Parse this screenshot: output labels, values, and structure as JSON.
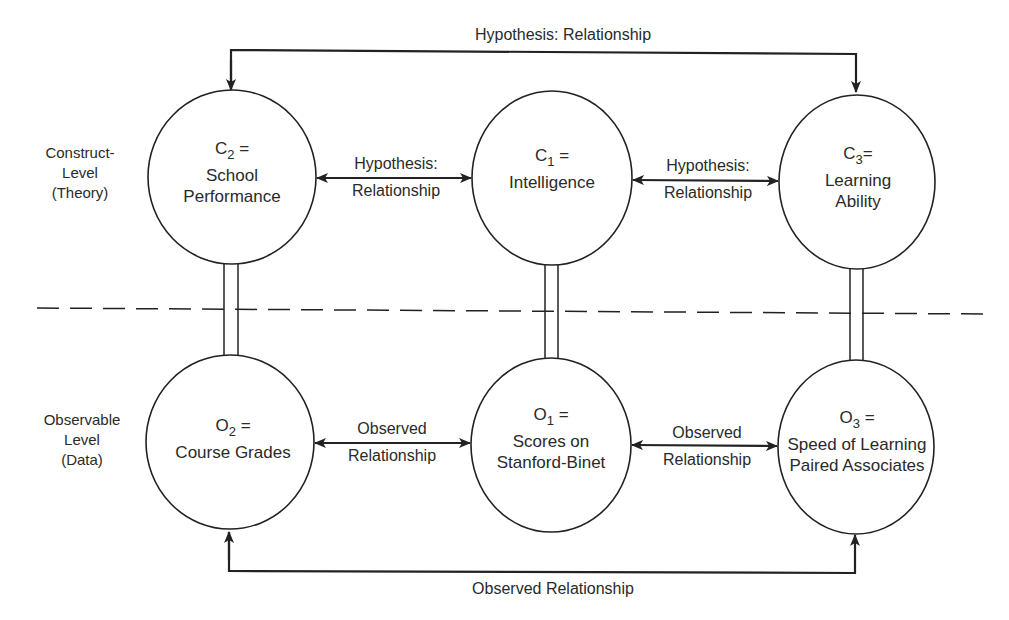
{
  "diagram": {
    "levels": {
      "construct": [
        "Construct-",
        "Level",
        "(Theory)"
      ],
      "observable": [
        "Observable",
        "Level",
        "(Data)"
      ]
    },
    "nodes": {
      "c2": {
        "letter": "C",
        "sub": "2",
        "eq": "=",
        "lines": [
          "School",
          "Performance"
        ]
      },
      "c1": {
        "letter": "C",
        "sub": "1",
        "eq": "=",
        "lines": [
          "Intelligence"
        ]
      },
      "c3": {
        "letter": "C",
        "sub": "3",
        "eq": "=",
        "lines": [
          "Learning",
          "Ability"
        ]
      },
      "o2": {
        "letter": "O",
        "sub": "2",
        "eq": "=",
        "lines": [
          "Course Grades"
        ]
      },
      "o1": {
        "letter": "O",
        "sub": "1",
        "eq": "=",
        "lines": [
          "Scores on",
          "Stanford-Binet"
        ]
      },
      "o3": {
        "letter": "O",
        "sub": "3",
        "eq": "=",
        "lines": [
          "Speed of Learning",
          "Paired Associates"
        ]
      }
    },
    "edges": {
      "top": "Hypothesis: Relationship",
      "c2_c1": [
        "Hypothesis:",
        "Relationship"
      ],
      "c1_c3": [
        "Hypothesis:",
        "Relationship"
      ],
      "o2_o1": [
        "Observed",
        "Relationship"
      ],
      "o1_o3": [
        "Observed",
        "Relationship"
      ],
      "bottom": "Observed Relationship"
    },
    "colors": {
      "stroke": "#222222",
      "background": "#ffffff"
    }
  }
}
